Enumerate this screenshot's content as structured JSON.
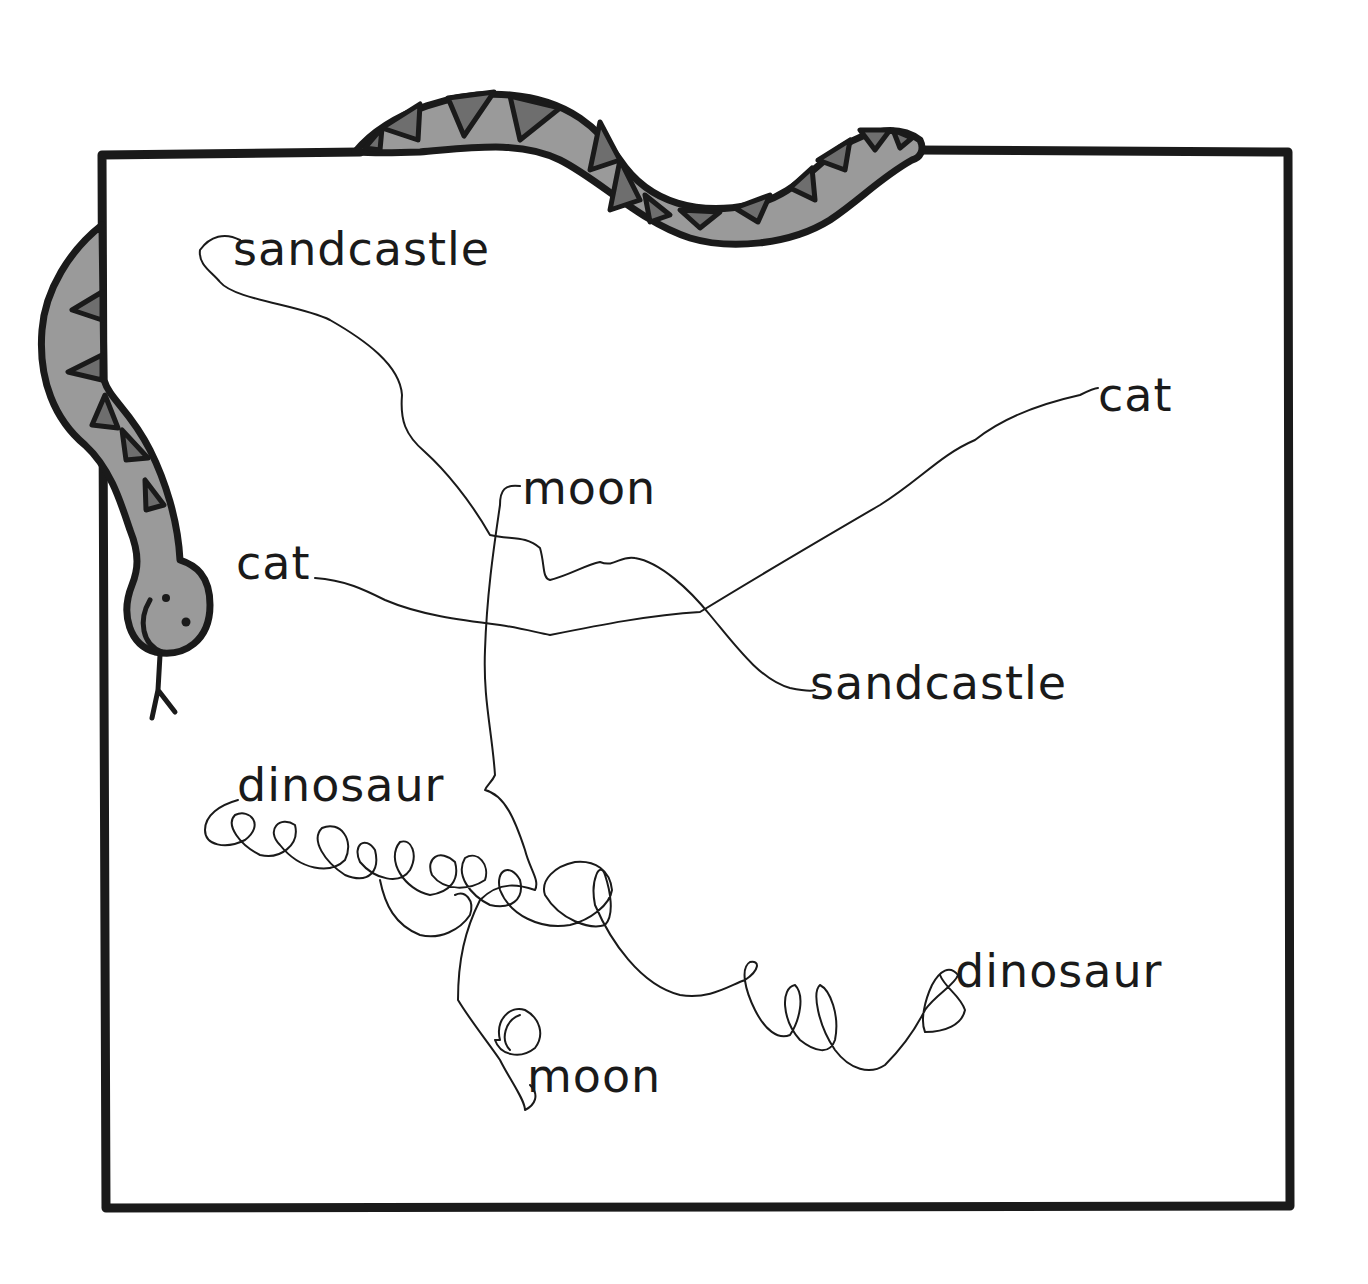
{
  "worksheet": {
    "type": "word-matching-worksheet",
    "instruction_visual": "lines drawn connecting matching words",
    "colors": {
      "ink": "#1a1a1a",
      "snake_body": "#9a9a9a",
      "snake_pattern": "#6e6e6e",
      "paper": "#ffffff"
    },
    "left_words": [
      {
        "id": "sandcastle_left",
        "text": "sandcastle"
      },
      {
        "id": "cat_left",
        "text": "cat"
      },
      {
        "id": "dinosaur_left",
        "text": "dinosaur"
      }
    ],
    "middle_words": [
      {
        "id": "moon_top",
        "text": "moon"
      },
      {
        "id": "moon_bottom",
        "text": "moon"
      }
    ],
    "right_words": [
      {
        "id": "cat_right",
        "text": "cat"
      },
      {
        "id": "sandcastle_right",
        "text": "sandcastle"
      },
      {
        "id": "dinosaur_right",
        "text": "dinosaur"
      }
    ],
    "matches": [
      {
        "from": "sandcastle",
        "to": "sandcastle"
      },
      {
        "from": "cat",
        "to": "cat"
      },
      {
        "from": "moon",
        "to": "moon"
      },
      {
        "from": "dinosaur",
        "to": "dinosaur"
      }
    ],
    "decorations": [
      "snake-border"
    ]
  }
}
